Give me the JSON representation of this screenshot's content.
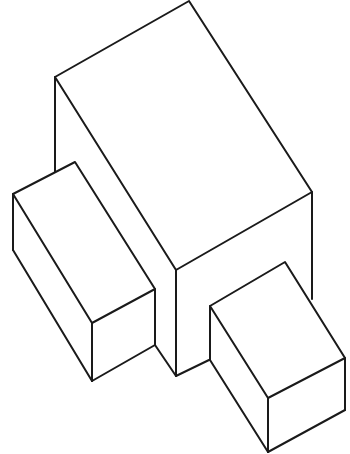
{
  "figure": {
    "background": "#ffffff",
    "stroke_color": "#1a1a1a",
    "parts": [
      {
        "name": "main-block"
      },
      {
        "name": "left-block"
      },
      {
        "name": "right-block"
      }
    ]
  }
}
